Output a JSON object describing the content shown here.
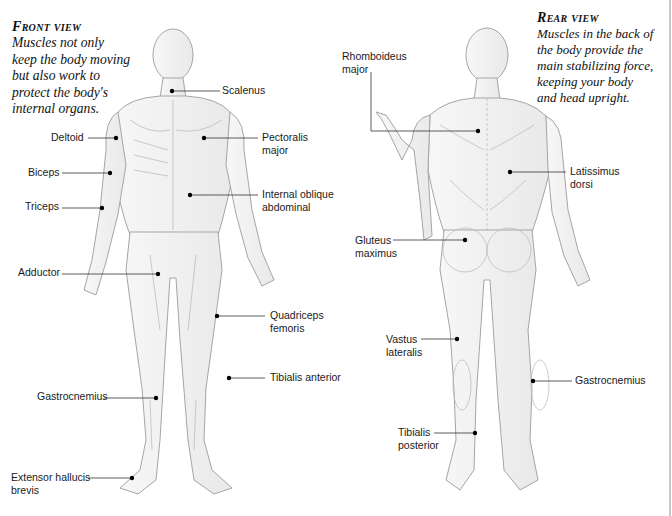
{
  "front": {
    "title": "Front view",
    "description": [
      "Muscles not only",
      "keep the body moving",
      "but also work to",
      "protect the body's",
      "internal organs."
    ],
    "labels": [
      {
        "id": "scalenus",
        "text": "Scalenus",
        "x": 222,
        "y": 87
      },
      {
        "id": "pectoralis-major",
        "text": "Pectoralis\nmajor",
        "x": 262,
        "y": 134
      },
      {
        "id": "internal-oblique",
        "text": "Internal oblique\nabdominal",
        "x": 262,
        "y": 186
      },
      {
        "id": "deltoid",
        "text": "Deltoid",
        "x": 51,
        "y": 129
      },
      {
        "id": "biceps",
        "text": "Biceps",
        "x": 28,
        "y": 165
      },
      {
        "id": "triceps",
        "text": "Triceps",
        "x": 25,
        "y": 198
      },
      {
        "id": "adductor",
        "text": "Adductor",
        "x": 18,
        "y": 267
      },
      {
        "id": "quadriceps-femoris",
        "text": "Quadriceps\nfemoris",
        "x": 270,
        "y": 308
      },
      {
        "id": "tibialis-anterior",
        "text": "Tibialis anterior",
        "x": 270,
        "y": 370
      },
      {
        "id": "gastrocnemius-front",
        "text": "Gastrocnemius",
        "x": 37,
        "y": 389
      },
      {
        "id": "extensor-hallucis-brevis",
        "text": "Extensor hallucis\nbrevis",
        "x": 11,
        "y": 470
      }
    ]
  },
  "rear": {
    "title": "Rear view",
    "description": [
      "Muscles in the back of",
      "the body provide the",
      "main stabilizing force,",
      "keeping your body",
      "and head upright."
    ],
    "labels": [
      {
        "id": "rhomboideus-major",
        "text": "Rhomboideus\nmajor",
        "x": 342,
        "y": 50
      },
      {
        "id": "latissimus-dorsi",
        "text": "Latissimus\ndorsi",
        "x": 570,
        "y": 163
      },
      {
        "id": "gluteus-maximus",
        "text": "Gluteus\nmaximus",
        "x": 355,
        "y": 234
      },
      {
        "id": "vastus-lateralis",
        "text": "Vastus\nlateralis",
        "x": 386,
        "y": 333
      },
      {
        "id": "gastrocnemius-rear",
        "text": "Gastrocnemius",
        "x": 575,
        "y": 374
      },
      {
        "id": "tibialis-posterior",
        "text": "Tibialis\nposterior",
        "x": 398,
        "y": 426
      }
    ]
  },
  "colors": {
    "leader_line": "#333333",
    "dot": "#000000",
    "sketch": "#9a9a9a",
    "sketch_fill": "#efefef"
  }
}
